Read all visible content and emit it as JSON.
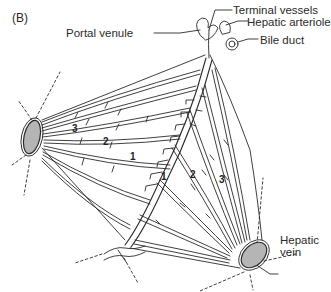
{
  "figure": {
    "panel_label": "(B)",
    "labels": {
      "portal_venule": "Portal venule",
      "terminal_vessels": "Terminal vessels",
      "hepatic_arteriole": "Hepatic arteriole",
      "bile_duct": "Bile duct",
      "hepatic_vein_line1": "Hepatic",
      "hepatic_vein_line2": "vein"
    },
    "zone_numbers": {
      "left_3": "3",
      "left_2": "2",
      "left_1": "1",
      "right_1": "1",
      "right_2": "2",
      "right_3": "3"
    },
    "colors": {
      "line": "#2a2a2a",
      "vein_fill": "#b5b5b5",
      "background": "#ffffff"
    }
  }
}
